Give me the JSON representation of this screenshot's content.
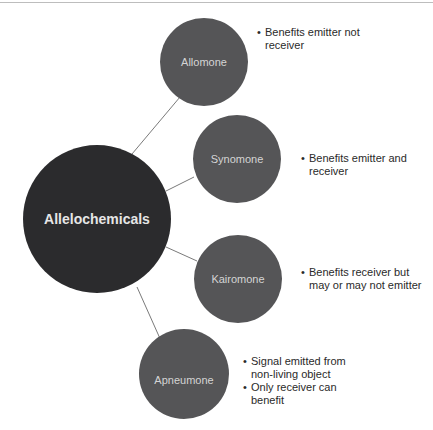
{
  "diagram": {
    "center": {
      "label": "Allelochemicals",
      "color": "#2b2b2d"
    },
    "node_color": "#555557",
    "line_color": "#7a7a7a",
    "nodes": [
      {
        "label": "Allomone",
        "bullets": [
          "Benefits emitter not receiver"
        ]
      },
      {
        "label": "Synomone",
        "bullets": [
          "Benefits emitter and receiver"
        ]
      },
      {
        "label": "Kairomone",
        "bullets": [
          "Benefits receiver but may or may not emitter"
        ]
      },
      {
        "label": "Apneumone",
        "bullets": [
          "Signal emitted from non-living object",
          "Only receiver can benefit"
        ]
      }
    ]
  }
}
